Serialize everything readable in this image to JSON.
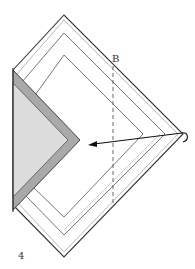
{
  "diagram": {
    "step_number": "4",
    "fold_line_label": "B",
    "colors": {
      "outline": "#333333",
      "inner_line": "#555555",
      "faint_line": "#999999",
      "dark_band": "#a9a9a9",
      "light_fill": "#dcdcdc",
      "arrow": "#111111"
    }
  }
}
